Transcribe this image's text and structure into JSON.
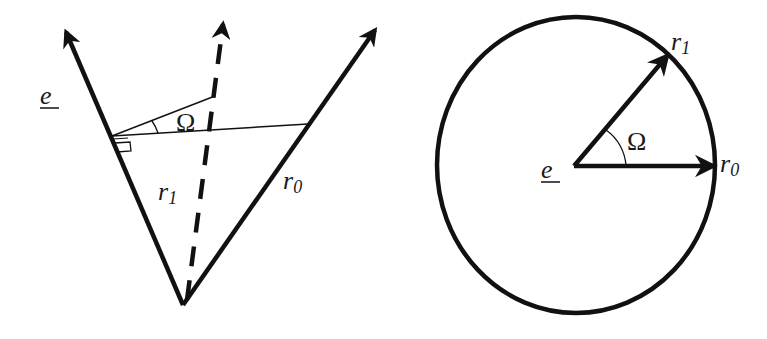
{
  "figure": {
    "left_panel": {
      "labels": {
        "e": "e",
        "r1": "r",
        "r1_sub": "1",
        "r0": "r",
        "r0_sub": "0",
        "angle": "Ω"
      },
      "description": "Two solid vectors from a common vertex with a dashed bisector; a perpendicular from vector e with angle Ω marked"
    },
    "right_panel": {
      "labels": {
        "e": "e",
        "r1": "r",
        "r1_sub": "1",
        "r0": "r",
        "r0_sub": "0",
        "angle": "Ω"
      },
      "description": "Circle centered at e with radius vectors r0 and r1 separated by angle Ω"
    },
    "colors": {
      "stroke": "#111111",
      "background": "#ffffff"
    }
  }
}
